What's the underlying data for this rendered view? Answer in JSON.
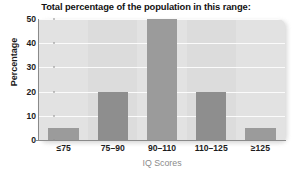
{
  "chart_data": {
    "type": "bar",
    "title": "Total percentage of the population in this range:",
    "xlabel": "IQ Scores",
    "ylabel": "Percentage",
    "categories": [
      "≤75",
      "75–90",
      "90–110",
      "110–125",
      "≥125"
    ],
    "values": [
      5,
      20,
      50,
      20,
      5
    ],
    "ylim": [
      0,
      50
    ],
    "yticks": [
      0,
      10,
      20,
      30,
      40,
      50
    ],
    "ytick_labels": [
      "0",
      "10",
      "20",
      "30",
      "40",
      "50"
    ],
    "grid": "horizontal",
    "legend": "none",
    "colors": {
      "bar": "#9b9b9b",
      "bar_alt": "#8e8e8e",
      "plot_background": "#e2e2e2",
      "gridline": "#fbfbfb",
      "axis": "#8a8a8a",
      "title_text": "#121212",
      "tick_text": "#1c1c1c",
      "xlabel_text": "#8b8b8b"
    }
  }
}
